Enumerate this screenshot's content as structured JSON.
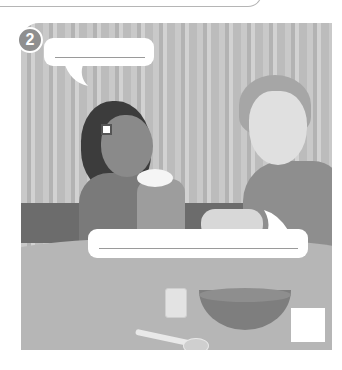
{
  "page": {
    "panel_number": "2",
    "speech_bubbles": [
      {
        "id": "girl-bubble",
        "text": ""
      },
      {
        "id": "boy-bubble",
        "text": ""
      }
    ],
    "answer_box": {
      "value": ""
    }
  },
  "colors": {
    "badge": "#8f8f8f",
    "bubble": "#ffffff",
    "table": "#b6b6b6",
    "wall_stripe_dark": "#b3b3b3",
    "wall_stripe_light": "#d2d2d2"
  }
}
